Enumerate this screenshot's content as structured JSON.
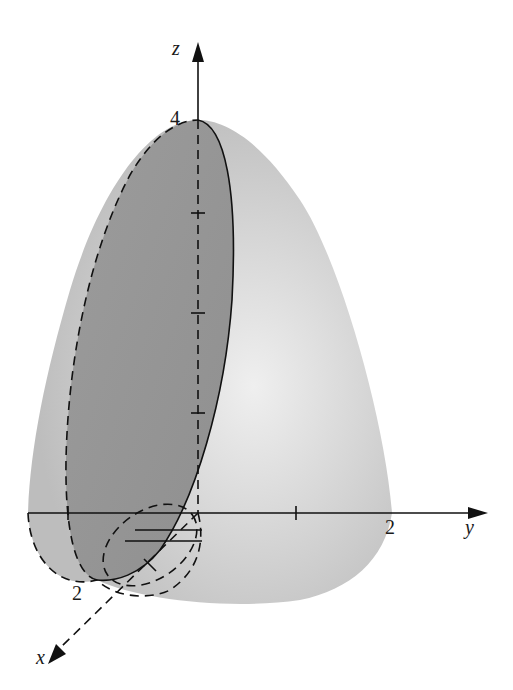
{
  "figure": {
    "axes": {
      "z": {
        "label": "z",
        "max_label": "4"
      },
      "y": {
        "label": "y",
        "tick_label": "2"
      },
      "x": {
        "label": "x",
        "tick_label": "2"
      }
    },
    "colors": {
      "surface_light": "#d9d9d9",
      "surface_mid": "#c4c4c4",
      "section_dark": "#9a9a9a",
      "line": "#111111",
      "background": "#ffffff"
    }
  }
}
